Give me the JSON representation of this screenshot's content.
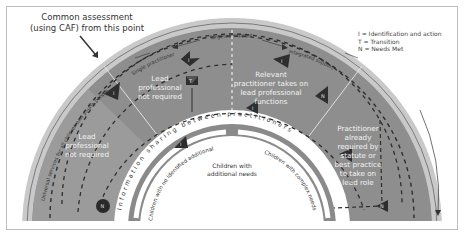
{
  "caption": {
    "line1": "Common assessment",
    "line2": "(using CAF) from this point"
  },
  "legend": {
    "items": [
      {
        "key": "I",
        "text": "I  = Identification and action"
      },
      {
        "key": "T",
        "text": "T  = Transition"
      },
      {
        "key": "N",
        "text": "N = Needs Met"
      }
    ]
  },
  "outer_arc_label": "Universal services for all children and young people",
  "top_arc_labels": {
    "single_practitioner": "Single practitioner",
    "targeted_support": "Targeted support",
    "integrated_support": "Integrated support"
  },
  "segments": {
    "far_left": [
      "Lead",
      "professional",
      "not required"
    ],
    "mid_left": [
      "Lead",
      "professional",
      "not required"
    ],
    "mid_right": [
      "Relevant",
      "practitioner takes on",
      "lead professional",
      "functions"
    ],
    "far_right": [
      "Practitioner",
      "already",
      "required by",
      "statute or",
      "best practice",
      "to take on",
      "lead role"
    ]
  },
  "info_ring_label": "Information sharing between practitioners",
  "inner_labels": {
    "left": "Children with no identified additional needs",
    "center": [
      "Children with",
      "additional needs"
    ],
    "right": "Children with complex needs"
  },
  "markers": {
    "identification": "I",
    "transition": "T",
    "needs_met": "N"
  },
  "colors": {
    "outer_rim": "#c9c9c9",
    "band_dark": "#8c8c8c",
    "band_light": "#9a9a9a",
    "info_ring": "#ffffff",
    "inner_band": "#8a8a8a",
    "marker": "#333333"
  }
}
